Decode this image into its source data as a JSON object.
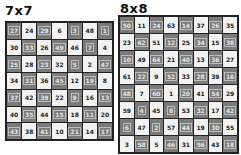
{
  "boards": [
    {
      "title": "7x7",
      "size": 7,
      "rows": [
        [
          27,
          24,
          29,
          6,
          3,
          48,
          1
        ],
        [
          30,
          33,
          26,
          49,
          46,
          7,
          4
        ],
        [
          25,
          28,
          23,
          32,
          5,
          2,
          47
        ],
        [
          34,
          31,
          36,
          45,
          12,
          19,
          8
        ],
        [
          37,
          42,
          39,
          22,
          9,
          16,
          13
        ],
        [
          40,
          35,
          44,
          15,
          18,
          11,
          20
        ],
        [
          43,
          38,
          41,
          10,
          21,
          14,
          17
        ]
      ]
    },
    {
      "title": "8x8",
      "size": 8,
      "rows": [
        [
          50,
          11,
          24,
          63,
          14,
          37,
          26,
          35
        ],
        [
          23,
          62,
          51,
          12,
          25,
          34,
          15,
          38
        ],
        [
          10,
          49,
          64,
          21,
          40,
          13,
          36,
          27
        ],
        [
          61,
          22,
          9,
          52,
          33,
          28,
          39,
          16
        ],
        [
          48,
          7,
          60,
          1,
          20,
          41,
          54,
          29
        ],
        [
          59,
          4,
          45,
          8,
          53,
          32,
          17,
          42
        ],
        [
          6,
          47,
          2,
          57,
          44,
          19,
          30,
          55
        ],
        [
          3,
          58,
          5,
          46,
          31,
          56,
          43,
          18
        ]
      ]
    }
  ],
  "colors": {
    "dark_cell": "#7a7a7a",
    "light_cell": "#f2f2f2",
    "border": "#222222"
  }
}
